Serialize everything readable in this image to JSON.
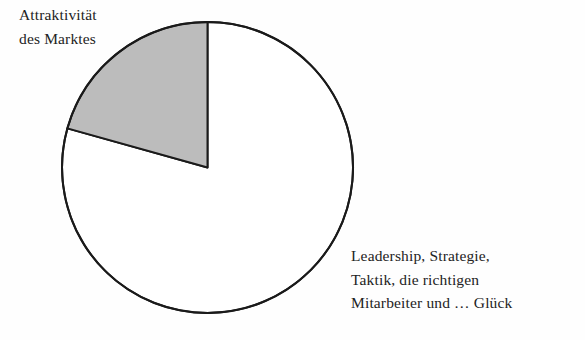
{
  "figure": {
    "background_color": "#fefefe",
    "width": 585,
    "height": 340
  },
  "labels": {
    "market_attractiveness": {
      "name": "Attraktivität des Marktes",
      "lines": [
        "Attraktivität",
        "des Marktes"
      ]
    },
    "success_factors": {
      "name": "Leadership, Strategie, Taktik, die richtigen Mitarbeiter und … Glück",
      "lines": [
        "Leadership, Strategie,",
        "Taktik, die richtigen",
        "Mitarbeiter und … Glück"
      ]
    }
  },
  "chart_data": {
    "type": "pie",
    "title": "",
    "subtitle": "",
    "xlabel": "",
    "ylabel": "",
    "grid": false,
    "legend_position": "callout-labels",
    "start_angle_deg": 90,
    "direction": "counterclockwise",
    "center": {
      "x": 207.5,
      "y": 167.5
    },
    "radius": 145.5,
    "slices": [
      {
        "label": "Attraktivität des Marktes",
        "value": 20.7,
        "unit": "%",
        "angle_deg": 74.4,
        "fill": "#bcbcbc",
        "stroke": "#1a1a1a",
        "start_angle_deg": 90,
        "end_angle_deg": 164.4
      },
      {
        "label": "Leadership, Strategie, Taktik, die richtigen Mitarbeiter und … Glück",
        "value": 79.3,
        "unit": "%",
        "angle_deg": 285.6,
        "fill": "#ffffff",
        "stroke": "#1a1a1a",
        "start_angle_deg": 164.4,
        "end_angle_deg": 450
      }
    ],
    "categories": [
      "Attraktivität des Marktes",
      "Leadership, Strategie, Taktik, die richtigen Mitarbeiter und … Glück"
    ],
    "values": [
      20.7,
      79.3
    ]
  },
  "style": {
    "slice_fill_gray": "#bcbcbc",
    "slice_fill_white": "#ffffff",
    "outline_color": "#1a1a1a",
    "outline_width": 2,
    "text_color": "#232323"
  }
}
